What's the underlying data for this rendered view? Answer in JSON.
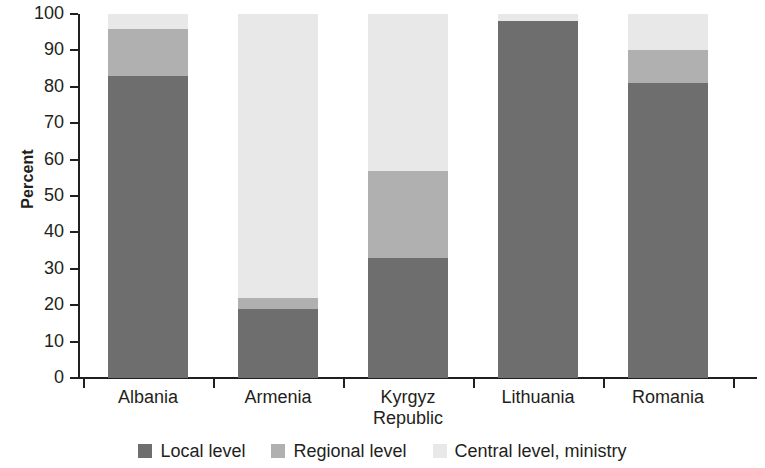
{
  "chart_data": {
    "type": "bar",
    "stacked": true,
    "title": "",
    "xlabel": "",
    "ylabel": "Percent",
    "ylim": [
      0,
      100
    ],
    "ytick_step": 10,
    "yticks": [
      0,
      10,
      20,
      30,
      40,
      50,
      60,
      70,
      80,
      90,
      100
    ],
    "ytick_labels": [
      "0",
      "10",
      "20",
      "30",
      "40",
      "50",
      "60",
      "70",
      "80",
      "90",
      "100"
    ],
    "grid": false,
    "legend_position": "bottom",
    "categories": [
      "Albania",
      "Armenia",
      "Kyrgyz Republic",
      "Lithuania",
      "Romania"
    ],
    "category_label_lines": [
      [
        "Albania"
      ],
      [
        "Armenia"
      ],
      [
        "Kyrgyz",
        "Republic"
      ],
      [
        "Lithuania"
      ],
      [
        "Romania"
      ]
    ],
    "series": [
      {
        "name": "Local level",
        "color": "#6e6e6e",
        "values": [
          83,
          19,
          33,
          98,
          81
        ]
      },
      {
        "name": "Regional level",
        "color": "#b0b0b0",
        "values": [
          13,
          3,
          24,
          0,
          9
        ]
      },
      {
        "name": "Central level, ministry",
        "color": "#e8e8e8",
        "values": [
          4,
          78,
          43,
          2,
          10
        ]
      }
    ],
    "cumulative_tops": [
      [
        83,
        96,
        100
      ],
      [
        19,
        22,
        100
      ],
      [
        33,
        57,
        100
      ],
      [
        98,
        98,
        100
      ],
      [
        81,
        90,
        100
      ]
    ]
  },
  "legend": {
    "items": [
      {
        "label": "Local level",
        "color": "#6e6e6e"
      },
      {
        "label": "Regional level",
        "color": "#b0b0b0"
      },
      {
        "label": "Central level, ministry",
        "color": "#e8e8e8"
      }
    ]
  }
}
